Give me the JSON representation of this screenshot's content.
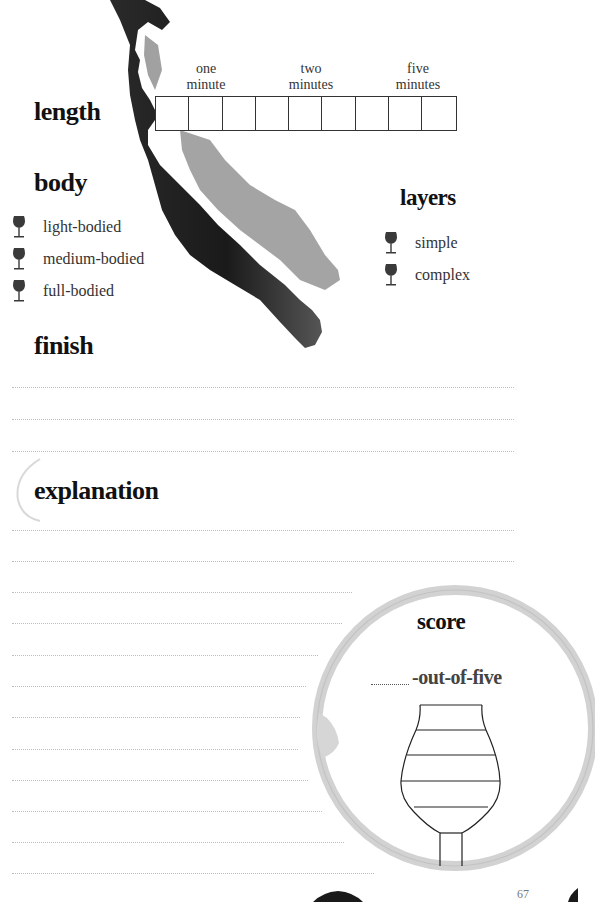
{
  "length": {
    "title": "length",
    "markers": [
      {
        "line1": "one",
        "line2": "minute"
      },
      {
        "line1": "two",
        "line2": "minutes"
      },
      {
        "line1": "five",
        "line2": "minutes"
      }
    ],
    "box_count": 9
  },
  "body": {
    "title": "body",
    "options": [
      "light-bodied",
      "medium-bodied",
      "full-bodied"
    ]
  },
  "layers": {
    "title": "layers",
    "options": [
      "simple",
      "complex"
    ]
  },
  "finish": {
    "title": "finish",
    "line_count": 3
  },
  "explanation": {
    "title": "explanation",
    "line_count": 12
  },
  "score": {
    "title": "score",
    "suffix": "-out-of-five",
    "glass_levels": 5
  },
  "page_number": "67",
  "colors": {
    "ink": "#111111",
    "text": "#333333",
    "stain_dark": "#1a1a1a",
    "stain_light": "#9a9a9a",
    "ring": "#cfcfcf",
    "rule": "#bdbdbd"
  }
}
